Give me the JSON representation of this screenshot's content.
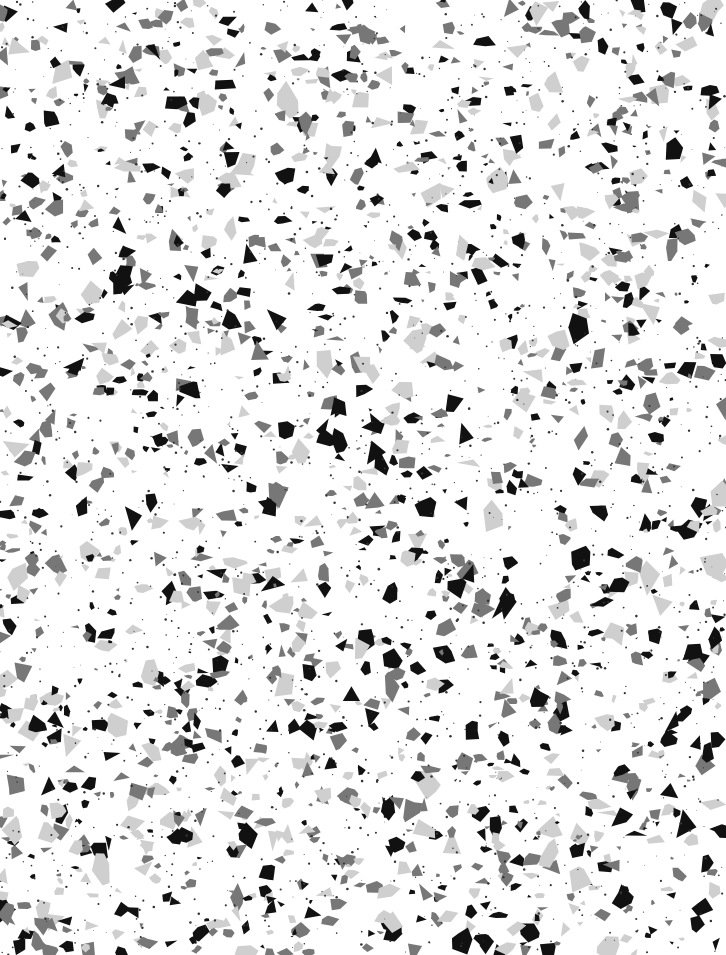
{
  "image": {
    "description": "Terrazzo speckle texture",
    "width": 726,
    "height": 955,
    "background": "#ffffff"
  },
  "texture": {
    "seed": 1337,
    "palette": [
      {
        "name": "black-chip",
        "color": "#111111",
        "count": 620,
        "min_size": 3,
        "max_size": 14
      },
      {
        "name": "dark-grey-chip",
        "color": "#777777",
        "count": 700,
        "min_size": 3,
        "max_size": 13
      },
      {
        "name": "light-grey-chip",
        "color": "#cfcfcf",
        "count": 520,
        "min_size": 4,
        "max_size": 16
      }
    ],
    "dots": {
      "color": "#333333",
      "count": 1800,
      "min_r": 0.4,
      "max_r": 1.3
    }
  }
}
